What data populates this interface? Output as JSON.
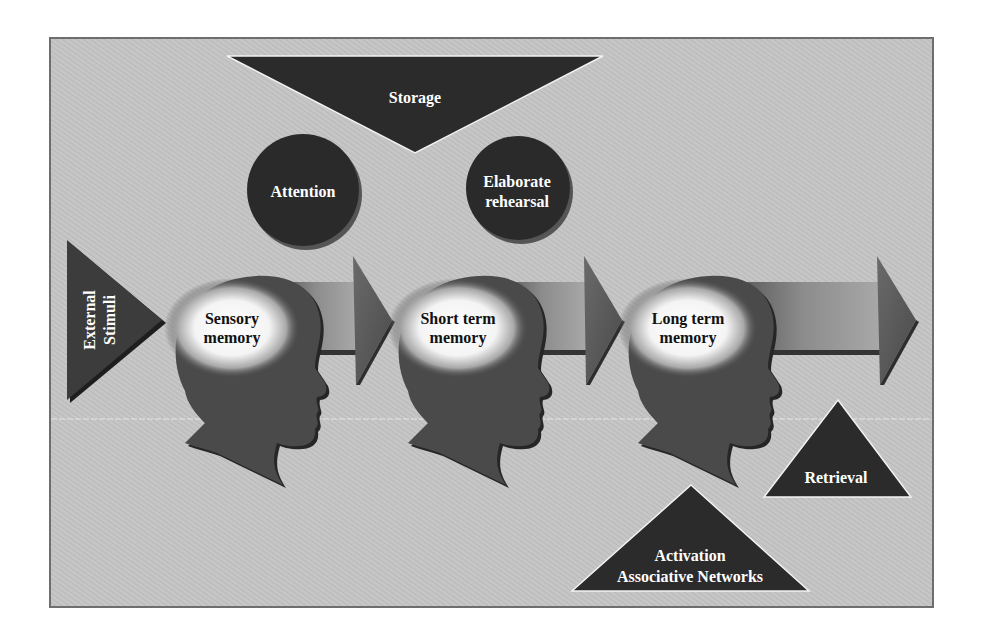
{
  "diagram": {
    "colors": {
      "background": "#c6c6c6",
      "frame_border": "#6e6e6e",
      "dark_shape": "#2b2b2b",
      "head": "#4a4a4a",
      "head_shadow": "#262626",
      "arrow_light": "#9a9a9a",
      "arrow_dark": "#555555",
      "glow_center": "#ffffff",
      "label_light": "#ffffff",
      "label_dark": "#111111"
    },
    "top": {
      "storage": {
        "label": "Storage"
      }
    },
    "processes": {
      "attention": {
        "label": "Attention"
      },
      "elaborate_rehearsal": {
        "line1": "Elaborate",
        "line2": "rehearsal"
      }
    },
    "input": {
      "external_stimuli": {
        "line1": "External",
        "line2": "Stimuli"
      }
    },
    "stages": [
      {
        "id": "sensory",
        "line1": "Sensory",
        "line2": "memory"
      },
      {
        "id": "short_term",
        "line1": "Short term",
        "line2": "memory"
      },
      {
        "id": "long_term",
        "line1": "Long term",
        "line2": "memory"
      }
    ],
    "bottom": {
      "retrieval": {
        "label": "Retrieval"
      },
      "activation": {
        "line1": "Activation",
        "line2": "Associative Networks"
      }
    }
  }
}
